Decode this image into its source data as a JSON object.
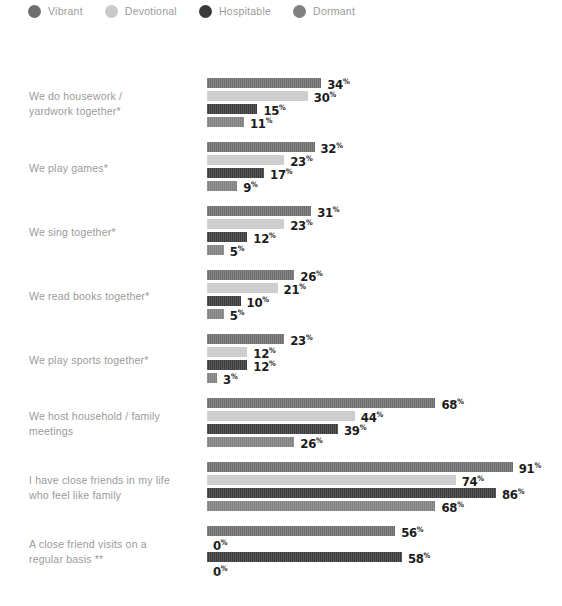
{
  "legend": {
    "position": "top-left",
    "items": [
      {
        "label": "Vibrant",
        "color": "#6e6e6e"
      },
      {
        "label": "Devotional",
        "color": "#c9c9c9"
      },
      {
        "label": "Hospitable",
        "color": "#3a3a3a"
      },
      {
        "label": "Dormant",
        "color": "#808080"
      }
    ]
  },
  "axis": {
    "bar_origin_px": 207,
    "px_per_percent": 3.36,
    "value_suffix": "%"
  },
  "chart_data": {
    "type": "bar",
    "orientation": "horizontal",
    "title": "",
    "subtitle": "",
    "xlabel": "",
    "ylabel": "",
    "xlim": [
      0,
      100
    ],
    "grid": false,
    "legend_position": "top-left",
    "value_unit": "%",
    "categories": [
      "We do housework / yardwork together*",
      "We play games*",
      "We sing together*",
      "We read books together*",
      "We play sports together*",
      "We host household / family meetings",
      "I have close friends in my life who feel like family",
      "A close friend visits on a regular basis **"
    ],
    "series": [
      {
        "name": "Vibrant",
        "color": "#6e6e6e",
        "values": [
          34,
          32,
          31,
          26,
          23,
          68,
          91,
          56
        ]
      },
      {
        "name": "Devotional",
        "color": "#c9c9c9",
        "values": [
          30,
          23,
          23,
          21,
          12,
          44,
          74,
          0
        ]
      },
      {
        "name": "Hospitable",
        "color": "#3a3a3a",
        "values": [
          15,
          17,
          12,
          10,
          12,
          39,
          86,
          58
        ]
      },
      {
        "name": "Dormant",
        "color": "#808080",
        "values": [
          11,
          9,
          5,
          5,
          3,
          26,
          68,
          0
        ]
      }
    ]
  },
  "groups": [
    {
      "label_lines": [
        "We do housework /",
        "yardwork together*"
      ],
      "top": 12,
      "bars": [
        {
          "series": "Vibrant",
          "value": 34,
          "label": "34"
        },
        {
          "series": "Devotional",
          "value": 30,
          "label": "30"
        },
        {
          "series": "Hospitable",
          "value": 15,
          "label": "15"
        },
        {
          "series": "Dormant",
          "value": 11,
          "label": "11"
        }
      ]
    },
    {
      "label_lines": [
        "We play games*"
      ],
      "top": 76,
      "bars": [
        {
          "series": "Vibrant",
          "value": 32,
          "label": "32"
        },
        {
          "series": "Devotional",
          "value": 23,
          "label": "23"
        },
        {
          "series": "Hospitable",
          "value": 17,
          "label": "17"
        },
        {
          "series": "Dormant",
          "value": 9,
          "label": "9"
        }
      ]
    },
    {
      "label_lines": [
        "We sing together*"
      ],
      "top": 140,
      "bars": [
        {
          "series": "Vibrant",
          "value": 31,
          "label": "31"
        },
        {
          "series": "Devotional",
          "value": 23,
          "label": "23"
        },
        {
          "series": "Hospitable",
          "value": 12,
          "label": "12"
        },
        {
          "series": "Dormant",
          "value": 5,
          "label": "5"
        }
      ]
    },
    {
      "label_lines": [
        "We read books together*"
      ],
      "top": 204,
      "bars": [
        {
          "series": "Vibrant",
          "value": 26,
          "label": "26"
        },
        {
          "series": "Devotional",
          "value": 21,
          "label": "21"
        },
        {
          "series": "Hospitable",
          "value": 10,
          "label": "10"
        },
        {
          "series": "Dormant",
          "value": 5,
          "label": "5"
        }
      ]
    },
    {
      "label_lines": [
        "We play sports together*"
      ],
      "top": 268,
      "bars": [
        {
          "series": "Vibrant",
          "value": 23,
          "label": "23"
        },
        {
          "series": "Devotional",
          "value": 12,
          "label": "12"
        },
        {
          "series": "Hospitable",
          "value": 12,
          "label": "12"
        },
        {
          "series": "Dormant",
          "value": 3,
          "label": "3"
        }
      ]
    },
    {
      "label_lines": [
        "We host household / family",
        "meetings"
      ],
      "top": 332,
      "bars": [
        {
          "series": "Vibrant",
          "value": 68,
          "label": "68"
        },
        {
          "series": "Devotional",
          "value": 44,
          "label": "44"
        },
        {
          "series": "Hospitable",
          "value": 39,
          "label": "39"
        },
        {
          "series": "Dormant",
          "value": 26,
          "label": "26"
        }
      ]
    },
    {
      "label_lines": [
        "I have close friends in my life",
        "who feel like family"
      ],
      "top": 396,
      "bars": [
        {
          "series": "Vibrant",
          "value": 91,
          "label": "91"
        },
        {
          "series": "Devotional",
          "value": 74,
          "label": "74"
        },
        {
          "series": "Hospitable",
          "value": 86,
          "label": "86"
        },
        {
          "series": "Dormant",
          "value": 68,
          "label": "68"
        }
      ]
    },
    {
      "label_lines": [
        "A close friend visits on a",
        "regular basis **"
      ],
      "top": 460,
      "bars": [
        {
          "series": "Vibrant",
          "value": 56,
          "label": "56"
        },
        {
          "series": "Devotional",
          "value": 0,
          "label": "0"
        },
        {
          "series": "Hospitable",
          "value": 58,
          "label": "58"
        },
        {
          "series": "Dormant",
          "value": 0,
          "label": "0"
        }
      ]
    }
  ]
}
